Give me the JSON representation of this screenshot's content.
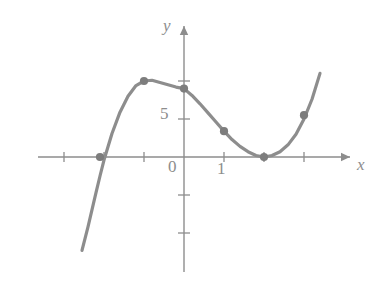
{
  "figure": {
    "kind": "cartesian-graph",
    "background_color": "#ffffff",
    "stroke_color": "#8d8d8d",
    "point_color": "#7d7d7d"
  },
  "axes": {
    "x_axis_label": "x",
    "y_axis_label": "y",
    "origin_label": "0",
    "x_tick_labels": [
      "1"
    ],
    "y_tick_labels": [
      "5"
    ]
  },
  "chart_data": {
    "type": "line",
    "title": "",
    "xlabel": "x",
    "ylabel": "y",
    "grid": false,
    "legend": null,
    "xlim": [
      -2.9,
      3.6
    ],
    "ylim": [
      -12.5,
      13
    ],
    "x_ticks": [
      -3,
      -2,
      -1,
      0,
      1,
      2,
      3
    ],
    "x_tick_labels": [
      "",
      "",
      "",
      "0",
      "1",
      "",
      ""
    ],
    "y_ticks": [
      -10,
      -5,
      0,
      5,
      10
    ],
    "y_tick_labels": [
      "",
      "",
      "",
      "5",
      ""
    ],
    "series": [
      {
        "name": "curve",
        "kind": "cubic",
        "x": [
          -2.55,
          -2.4,
          -2.2,
          -2.1,
          -2.0,
          -1.8,
          -1.6,
          -1.4,
          -1.2,
          -1.0,
          -0.8,
          -0.6,
          -0.4,
          -0.2,
          0.0,
          0.2,
          0.4,
          0.6,
          0.8,
          1.0,
          1.2,
          1.4,
          1.6,
          1.8,
          2.0,
          2.2,
          2.4,
          2.6,
          2.8,
          3.0,
          3.2,
          3.4
        ],
        "y": [
          -12.3,
          -9.2,
          -4.7,
          -2.5,
          -0.4,
          3.1,
          5.9,
          8.0,
          9.4,
          10.0,
          10.1,
          9.8,
          9.5,
          9.2,
          9.0,
          8.1,
          7.0,
          5.8,
          4.6,
          3.4,
          2.3,
          1.4,
          0.7,
          0.2,
          0.0,
          0.2,
          0.7,
          1.6,
          3.0,
          5.0,
          7.6,
          11.0
        ]
      }
    ],
    "marked_points": [
      {
        "x": -2.1,
        "y": 0.0,
        "label": ""
      },
      {
        "x": -1.0,
        "y": 10.0,
        "label": ""
      },
      {
        "x": 0.0,
        "y": 9.0,
        "label": ""
      },
      {
        "x": 1.0,
        "y": 3.4,
        "label": ""
      },
      {
        "x": 2.0,
        "y": 0.0,
        "label": ""
      },
      {
        "x": 3.0,
        "y": 5.5,
        "label": ""
      }
    ]
  }
}
